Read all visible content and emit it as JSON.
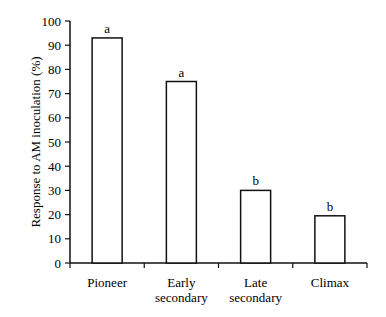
{
  "chart_data": {
    "type": "bar",
    "title": "",
    "xlabel": "",
    "ylabel": "Response to AM inoculation (%)",
    "ylim": [
      0,
      100
    ],
    "yticks": [
      0,
      10,
      20,
      30,
      40,
      50,
      60,
      70,
      80,
      90,
      100
    ],
    "grid": false,
    "categories": [
      "Pioneer",
      "Early secondary",
      "Late secondary",
      "Climax"
    ],
    "category_lines": [
      [
        "Pioneer"
      ],
      [
        "Early",
        "secondary"
      ],
      [
        "Late",
        "secondary"
      ],
      [
        "Climax"
      ]
    ],
    "values": [
      93,
      75,
      30,
      19.5
    ],
    "annotations": [
      "a",
      "a",
      "b",
      "b"
    ],
    "bar_fill": "#ffffff",
    "bar_stroke": "#111111"
  }
}
